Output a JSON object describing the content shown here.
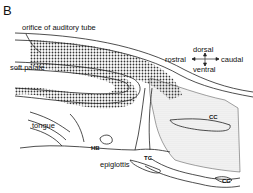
{
  "panel_label": "B",
  "labels": {
    "orifice": "orifice of auditory tube",
    "soft_palate": "soft palate",
    "tongue": "tongue",
    "epiglottis": "epiglottis",
    "hb": "HB",
    "tc": "TC",
    "cc_upper": "CC",
    "cc_lower": "CC"
  },
  "orientation": {
    "dorsal": "dorsal",
    "ventral": "ventral",
    "rostral": "rostral",
    "caudal": "caudal"
  },
  "colors": {
    "line": "#222222",
    "dense_dots": "#333333",
    "fine_stipple": "#777777",
    "background": "#ffffff"
  }
}
